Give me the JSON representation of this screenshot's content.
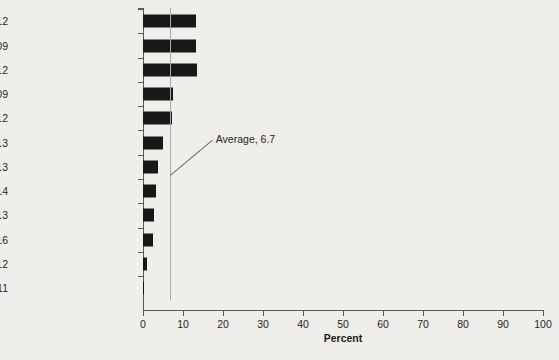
{
  "chart_data": {
    "type": "bar",
    "orientation": "horizontal",
    "title": "",
    "xlabel": "Percent",
    "ylabel": "",
    "xlim": [
      0,
      100
    ],
    "xticks": [
      0,
      10,
      20,
      30,
      40,
      50,
      60,
      70,
      80,
      90,
      100
    ],
    "xtick_labels": [
      "0",
      "10",
      "20",
      "30",
      "40",
      "50",
      "60",
      "70",
      "80",
      "90",
      "100"
    ],
    "grid": false,
    "legend": null,
    "categories": [
      "Poland 2012",
      "Slovak Republic 2009",
      "Mauritius 2012",
      "Latvia 2009",
      "Romania 2012",
      "Ukraine 2013",
      "Honduras 2013",
      "Panama 2014",
      "China 2013",
      "Russian Federation 2016",
      "Albania 2012",
      "Tajikistan 2011"
    ],
    "values": [
      13.3,
      13.3,
      13.5,
      7.5,
      7.2,
      5.0,
      3.8,
      3.3,
      2.8,
      2.5,
      1.0,
      0.3
    ],
    "bar_color": "#181818",
    "annotations": [
      {
        "name": "average-line",
        "label": "Average, 6.7",
        "value": 6.7,
        "line_color": "#a9a9a9"
      }
    ]
  },
  "axis": {
    "x_title": "Percent"
  },
  "colors": {
    "background": "#efeeeb",
    "bar": "#181818",
    "axis": "#58585a",
    "average_line": "#a9a9a9",
    "text": "#1f1f1f"
  }
}
